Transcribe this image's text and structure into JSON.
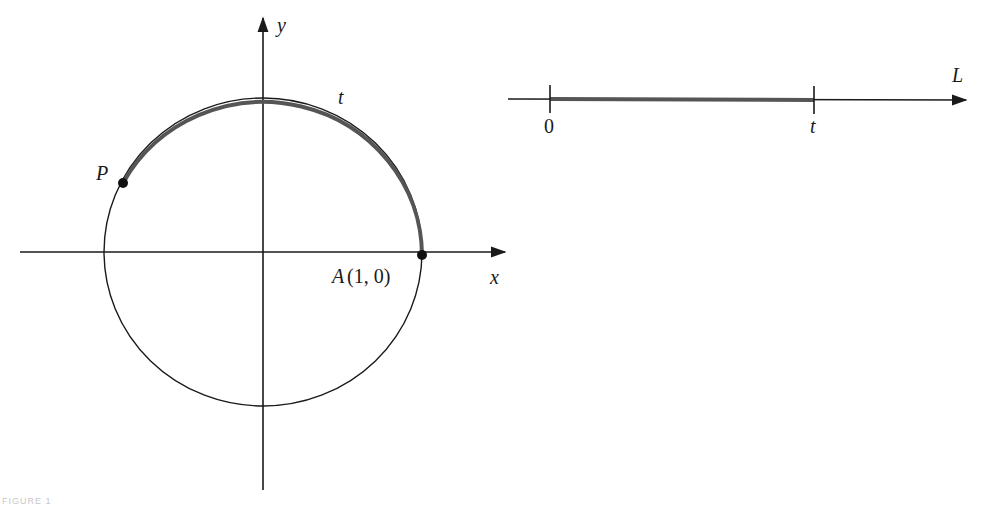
{
  "figure": {
    "caption": "FIGURE 1",
    "left_diagram": {
      "x_axis_label": "x",
      "y_axis_label": "y",
      "arc_label": "t",
      "point_p_label": "P",
      "point_a_label": "A",
      "point_a_coords": "(1, 0)"
    },
    "right_diagram": {
      "line_label": "L",
      "tick_start_label": "0",
      "tick_end_label": "t"
    },
    "colors": {
      "stroke": "#1a1a1a",
      "highlight": "#555555"
    }
  }
}
